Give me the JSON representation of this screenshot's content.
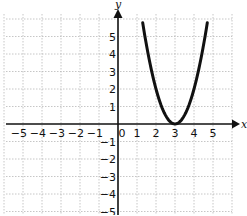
{
  "chart_data": {
    "type": "line",
    "title": "",
    "xlabel": "x",
    "ylabel": "y",
    "xlim": [
      -5.5,
      5.5
    ],
    "ylim": [
      -5.2,
      6.2
    ],
    "grid": true,
    "x_ticks": [
      "-5",
      "-4",
      "-3",
      "-2",
      "-1",
      "0",
      "1",
      "2",
      "3",
      "4",
      "5"
    ],
    "y_ticks": [
      "5",
      "4",
      "3",
      "2",
      "1",
      "-1",
      "-2",
      "-3",
      "-4",
      "-5"
    ],
    "series": [
      {
        "name": "parabola",
        "equation": "y = 2(x - 3)^2",
        "vertex": [
          3,
          0
        ],
        "x": [
          1.3,
          1.5,
          2.0,
          2.5,
          3.0,
          3.5,
          4.0,
          4.5,
          4.7
        ],
        "y": [
          5.78,
          4.5,
          2.0,
          0.5,
          0.0,
          0.5,
          2.0,
          4.5,
          5.78
        ]
      }
    ]
  },
  "axes": {
    "x_label": "x",
    "y_label": "y",
    "origin_label": "0"
  },
  "colors": {
    "curve": "#111111",
    "axis": "#111111",
    "grid": "#b8b8b8"
  }
}
